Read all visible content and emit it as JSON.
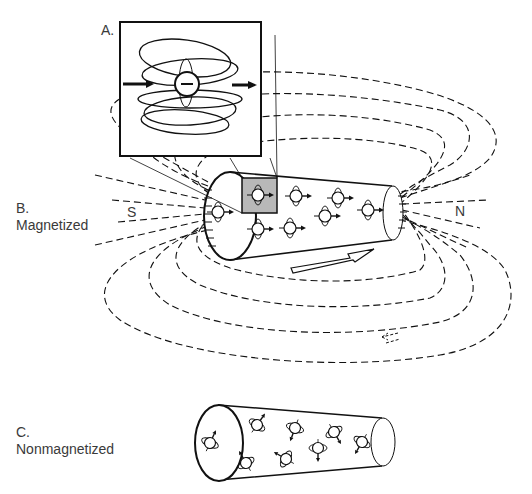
{
  "labels": {
    "a_letter": "A.",
    "b_letter": "B.",
    "b_text": "Magnetized",
    "c_letter": "C.",
    "c_text": "Nonmagnetized",
    "south": "S",
    "north": "N"
  },
  "colors": {
    "line": "#111111",
    "highlight_box": "#b8b8b8",
    "text": "#3a3a3a",
    "background": "#ffffff"
  },
  "figure": {
    "panel_a": "zoomed inset of single magnetic domain / atom with field loops and aligned arrows",
    "panel_b": "magnetized cylinder with aligned dipoles and dashed external field lines from N to S",
    "panel_c": "nonmagnetized cylinder with randomly oriented dipoles",
    "icons": [
      "dipole-icon",
      "field-direction-arrow-icon",
      "magnetization-arrow-icon"
    ]
  }
}
